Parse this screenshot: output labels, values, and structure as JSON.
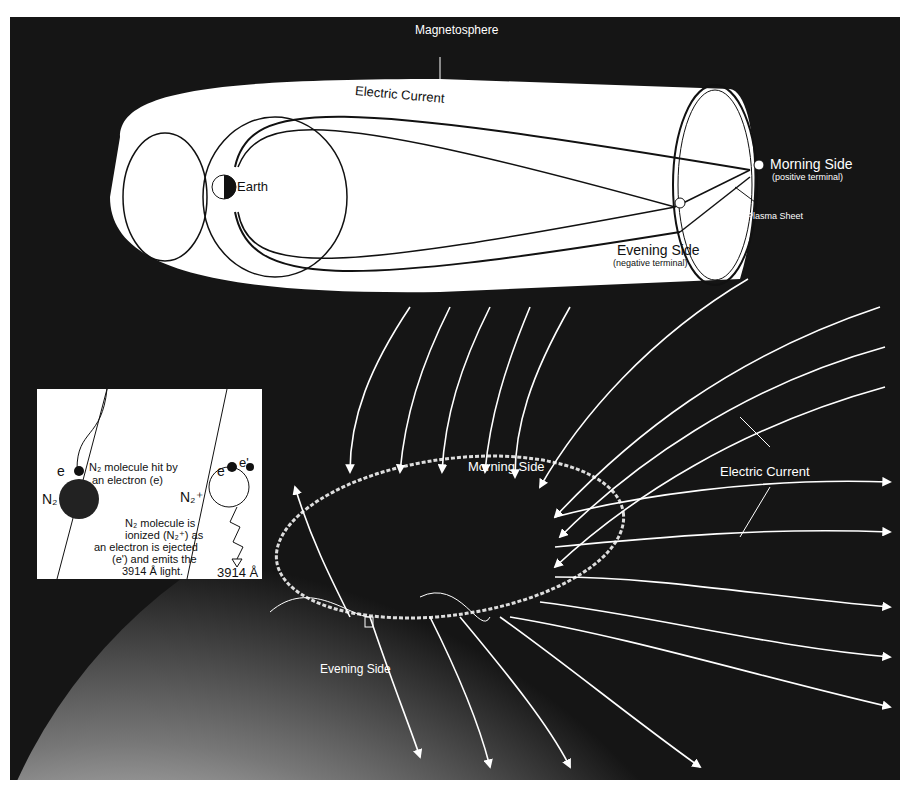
{
  "diagram": {
    "magnetosphere": {
      "title": "Magnetosphere",
      "electric_current": "Electric Current",
      "earth": "Earth",
      "morning_side": "Morning Side",
      "morning_sub": "(positive terminal)",
      "evening_side": "Evening Side",
      "evening_sub": "(negative terminal)",
      "plasma_sheet": "Plasma Sheet",
      "plus": "+",
      "minus": "−"
    },
    "aurora": {
      "morning_side": "Morning Side",
      "evening_side": "Evening Side",
      "electric_current": "Electric Current"
    },
    "inset": {
      "e1": "e",
      "n2": "N₂",
      "hit_text_1": "N₂ molecule hit by",
      "hit_text_2": "an electron (e)",
      "e2": "e",
      "e_prime": "e'",
      "n2_plus": "N₂⁺",
      "ionized_1": "N₂ molecule is",
      "ionized_2": "ionized (N₂⁺) as",
      "ionized_3": "an electron is ejected",
      "ionized_4": "(e') and emits the",
      "ionized_5": "3914 Å light.",
      "wavelength": "3914 Å"
    },
    "colors": {
      "background": "#151515",
      "foreground": "#ffffff",
      "ink": "#111111"
    }
  }
}
